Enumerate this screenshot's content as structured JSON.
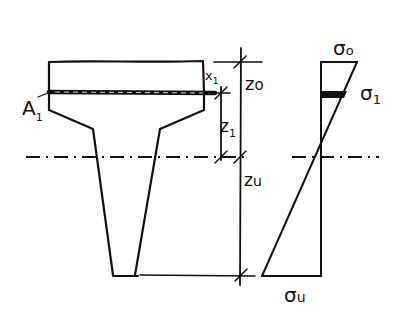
{
  "diagram": {
    "type": "cross-section-stress-distribution",
    "colors": {
      "ink": "#111111",
      "background": "#ffffff"
    },
    "section": {
      "shape": "T-beam with tapered web",
      "layer_label": "A",
      "layer_label_sub": "1"
    },
    "dimensions": {
      "x1_label": "x",
      "x1_sub": "1",
      "z0_label": "z",
      "z0_sub": "o",
      "z1_label": "z",
      "z1_sub": "1",
      "zu_label": "z",
      "zu_sub": "u"
    },
    "stress": {
      "top_label": "σ",
      "top_sub": "o",
      "layer_label": "σ",
      "layer_sub": "1",
      "bottom_label": "σ",
      "bottom_sub": "u"
    }
  }
}
